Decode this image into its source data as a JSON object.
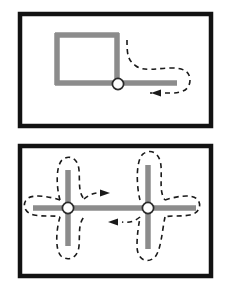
{
  "figure": {
    "kind": "two-panel-diagram",
    "background_color": "#ffffff",
    "panel_border_color": "#121212",
    "edge_color": "#8c8c8c",
    "node_fill_color": "#ffffff",
    "node_stroke_color": "#2b2b2b",
    "path_color": "#1a1a1a",
    "panels": [
      {
        "id": "panel-top",
        "label": "",
        "graph": {
          "type": "square-with-tail",
          "edges": [
            {
              "name": "square-top",
              "x1": 57,
              "y1": 35,
              "x2": 117,
              "y2": 35
            },
            {
              "name": "square-left",
              "x1": 57,
              "y1": 35,
              "x2": 57,
              "y2": 83
            },
            {
              "name": "square-bottom",
              "x1": 57,
              "y1": 83,
              "x2": 117,
              "y2": 83
            },
            {
              "name": "square-right",
              "x1": 117,
              "y1": 35,
              "x2": 117,
              "y2": 83
            },
            {
              "name": "tail-right",
              "x1": 117,
              "y1": 83,
              "x2": 177,
              "y2": 83
            }
          ],
          "nodes": [
            {
              "name": "junction-node",
              "cx": 118,
              "cy": 84,
              "r": 6
            }
          ]
        },
        "traversal_path": {
          "style": "dashed",
          "arrows": [
            {
              "name": "arrow-left-top-panel",
              "x": 160,
              "y": 93,
              "direction": "left"
            }
          ]
        }
      },
      {
        "id": "panel-bottom",
        "label": "",
        "graph": {
          "type": "double-cross",
          "edges": [
            {
              "name": "left-cross-vertical",
              "x1": 68,
              "y1": 170,
              "x2": 68,
              "y2": 245
            },
            {
              "name": "left-cross-horizontal",
              "x1": 33,
              "y1": 208,
              "x2": 148,
              "y2": 208
            },
            {
              "name": "right-cross-vertical",
              "x1": 148,
              "y1": 165,
              "x2": 148,
              "y2": 248
            },
            {
              "name": "right-cross-horizontal",
              "x1": 148,
              "y1": 208,
              "x2": 196,
              "y2": 208
            }
          ],
          "nodes": [
            {
              "name": "left-junction-node",
              "cx": 68,
              "cy": 208,
              "r": 6
            },
            {
              "name": "right-junction-node",
              "cx": 148,
              "cy": 208,
              "r": 6
            }
          ]
        },
        "traversal_path": {
          "style": "dashed",
          "arrows": [
            {
              "name": "arrow-right-bottom-panel",
              "x": 98,
              "y": 195,
              "direction": "right"
            },
            {
              "name": "arrow-left-bottom-panel",
              "x": 117,
              "y": 221,
              "direction": "left"
            }
          ]
        }
      }
    ]
  }
}
